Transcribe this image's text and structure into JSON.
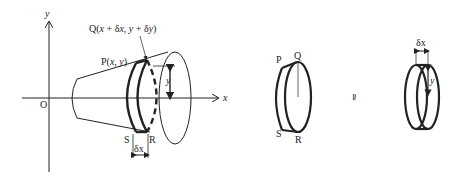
{
  "diagram": {
    "type": "solid of revolution – volume element (disc approximation)",
    "axes": {
      "x_label": "x",
      "y_label": "y",
      "origin_label": "O"
    },
    "main_figure": {
      "point_P": "P(x, y)",
      "point_Q": "Q(x + δx, y + δy)",
      "point_S": "S",
      "point_R": "R",
      "radius_label": "y",
      "width_label": "δx"
    },
    "frustum_figure": {
      "P": "P",
      "Q": "Q",
      "S": "S",
      "R": "R"
    },
    "approx_symbol": "≃",
    "cylinder_figure": {
      "width_label": "δx",
      "radius_label": "y"
    }
  }
}
